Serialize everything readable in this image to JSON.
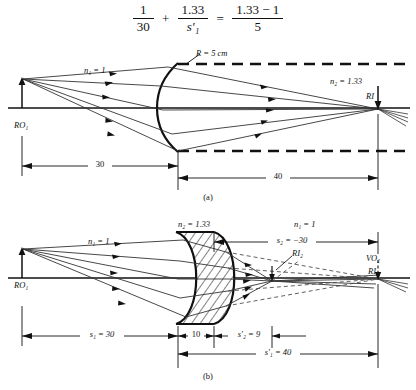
{
  "equation": {
    "term1_num": "1",
    "term1_den": "30",
    "plus": "+",
    "term2_num": "1.33",
    "term2_den": "s′₁",
    "equals": "=",
    "rhs_num": "1.33 − 1",
    "rhs_den": "5"
  },
  "figure_a": {
    "caption": "(a)",
    "labels": {
      "n1": "n₁ = 1",
      "n2": "n₂ = 1.33",
      "radius": "R = 5 cm",
      "object": "RO₁",
      "image": "RI"
    },
    "dimensions": [
      {
        "name": "object-distance",
        "value": "30"
      },
      {
        "name": "image-distance",
        "value": "40"
      }
    ]
  },
  "figure_b": {
    "caption": "(b)",
    "labels": {
      "n1_left": "n₁ = 1",
      "n2_lens": "n₂ = 1.33",
      "n1_right": "n₁ = 1",
      "object": "RO₁",
      "image2": "RI₂",
      "virtual_object2": "VO₂",
      "image1": "RI₁",
      "s2": "s₂ = −30"
    },
    "dimensions": [
      {
        "name": "s1",
        "value": "s₁ = 30"
      },
      {
        "name": "thickness",
        "value": "10"
      },
      {
        "name": "s2prime",
        "value": "s′₂ = 9"
      },
      {
        "name": "s1prime",
        "value": "s′₁ = 40"
      }
    ]
  },
  "colors": {
    "ink": "#111111",
    "axis": "#111111",
    "ray": "#333333"
  }
}
